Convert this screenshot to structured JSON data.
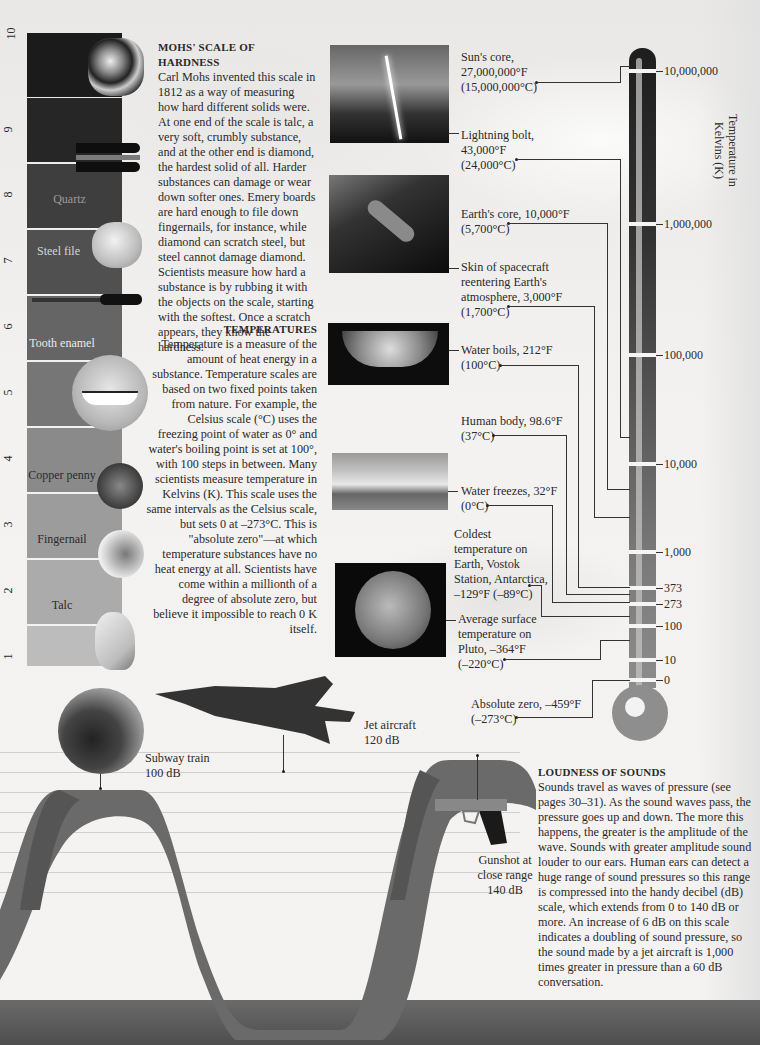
{
  "colors": {
    "band_10": "#1b1b1b",
    "band_9": "#2a2a2a",
    "band_8": "#3c3c3c",
    "band_7": "#4d4d4d",
    "band_6": "#5f5f5f",
    "band_5": "#707070",
    "band_4": "#828282",
    "band_3": "#949494",
    "band_2": "#a5a5a5",
    "band_1": "#b6b6b6",
    "thermo_dark": "#2b2b2b",
    "thermo_mid": "#6a6a6a",
    "thermo_light": "#8f8f8f",
    "wave": "#6a6a6a",
    "wave_shadow": "#555555"
  },
  "mohs": {
    "heading": "MOHS' SCALE OF HARDNESS",
    "body": "Carl Mohs invented this scale in 1812 as a way of measuring how hard different solids were. At one end of the scale is talc, a very soft, crumbly substance, and at the other end is diamond, the hardest solid of all. Harder substances can damage or wear down softer ones. Emery boards are hard enough to file down fingernails, for instance, while diamond can scratch steel, but steel cannot damage diamond. Scientists measure how hard a substance is by rubbing it with the objects on the scale, starting with the softest. Once a scratch appears, they know the hardness.",
    "scale_numbers": [
      "10",
      "9",
      "8",
      "7",
      "6",
      "5",
      "4",
      "3",
      "2",
      "1"
    ],
    "bands": [
      {
        "level": "10",
        "label": "",
        "object": "diamond-icon"
      },
      {
        "level": "9",
        "label": "",
        "object": "emery-board-icon"
      },
      {
        "level": "8",
        "label": "Quartz",
        "object": "quartz-crystal-icon"
      },
      {
        "level": "7",
        "label": "Steel file",
        "object": "steel-file-icon"
      },
      {
        "level": "6",
        "label": "Tooth enamel",
        "object": "smile-icon"
      },
      {
        "level": "5",
        "label": "",
        "object": ""
      },
      {
        "level": "4",
        "label": "Copper penny",
        "object": "penny-icon"
      },
      {
        "level": "3",
        "label": "Fingernail",
        "object": "hand-icon"
      },
      {
        "level": "2",
        "label": "Talc",
        "object": "talc-rock-icon"
      },
      {
        "level": "1",
        "label": "",
        "object": ""
      }
    ]
  },
  "temperatures": {
    "heading": "TEMPERATURES",
    "body": "Temperature is a measure of the amount of heat energy in a substance. Temperature scales are based on two fixed points taken from nature. For example, the Celsius scale (°C) uses the freezing point of water as 0° and water's boiling point is set at 100°, with 100 steps in between. Many scientists measure temperature in Kelvins (K). This scale uses the same intervals as the Celsius scale, but sets 0 at –273°C. This is \"absolute zero\"—at which temperature substances have no heat energy at all. Scientists have come within a millionth of a degree of absolute zero, but believe it impossible to reach 0 K itself.",
    "axis_title": "Temperature in Kelvins (K)",
    "ticks": [
      "10,000,000",
      "1,000,000",
      "100,000",
      "10,000",
      "1,000",
      "373",
      "273",
      "100",
      "10",
      "0"
    ],
    "labels": [
      {
        "line1": "Sun's core,",
        "line2": "27,000,000°F",
        "line3": "(15,000,000°C)"
      },
      {
        "line1": "Lightning bolt,",
        "line2": "43,000°F",
        "line3": "(24,000°C)"
      },
      {
        "line1": "Earth's core, 10,000°F",
        "line2": "(5,700°C)"
      },
      {
        "line1": "Skin of spacecraft",
        "line2": "reentering Earth's",
        "line3": "atmosphere, 3,000°F",
        "line4": "(1,700°C)"
      },
      {
        "line1": "Water boils, 212°F",
        "line2": "(100°C)"
      },
      {
        "line1": "Human body, 98.6°F",
        "line2": "(37°C)"
      },
      {
        "line1": "Water freezes, 32°F",
        "line2": "(0°C)"
      },
      {
        "line1": "Coldest",
        "line2": "temperature on",
        "line3": "Earth, Vostok",
        "line4": "Station, Antarctica,",
        "line5": "–129°F (–89°C)"
      },
      {
        "line1": "Average surface",
        "line2": "temperature on",
        "line3": "Pluto, –364°F",
        "line4": "(–220°C)"
      },
      {
        "line1": "Absolute zero, –459°F",
        "line2": "(–273°C)"
      }
    ],
    "photos": [
      "lightning-photo",
      "spacecraft-photo",
      "boiling-water-photo",
      "iceberg-photo",
      "pluto-photo"
    ]
  },
  "sounds": {
    "heading": "LOUDNESS OF SOUNDS",
    "body": "Sounds travel as waves of pressure (see pages 30–31). As the sound waves pass, the pressure goes up and down. The more this happens, the greater is the amplitude of the wave. Sounds with greater amplitude sound louder to our ears. Human ears can detect a huge range of sound pressures so this range is compressed into the handy decibel (dB) scale, which extends from 0 to 140 dB or more. An increase of 6 dB on this scale indicates a doubling of sound pressure, so the sound made by a jet aircraft is 1,000 times greater in pressure than a 60 dB conversation.",
    "examples": [
      {
        "name": "Subway train",
        "value": "100 dB"
      },
      {
        "name": "Jet aircraft",
        "value": "120 dB"
      },
      {
        "name": "Gunshot at close range",
        "name1": "Gunshot at",
        "name2": "close range",
        "value": "140 dB"
      }
    ]
  }
}
